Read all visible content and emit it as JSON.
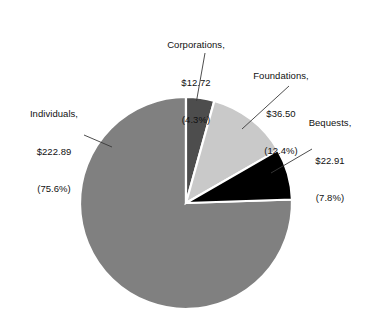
{
  "chart_data": {
    "type": "pie",
    "title": "",
    "xlabel": "",
    "ylabel": "",
    "legend_position": "none",
    "grid": false,
    "units": "billions of dollars",
    "total_value": 295.02,
    "start_angle_deg": 0,
    "direction": "clockwise",
    "categories": [
      "Corporations",
      "Foundations",
      "Bequests",
      "Individuals"
    ],
    "values": [
      12.72,
      36.5,
      22.91,
      222.89
    ],
    "percentages": [
      4.3,
      12.4,
      7.8,
      75.6
    ],
    "colors": [
      "#4d4d4d",
      "#c9c9c9",
      "#000000",
      "#808080"
    ],
    "slices": [
      {
        "name": "Corporations",
        "value": 12.72,
        "value_label": "$12.72",
        "percent": 4.3,
        "percent_label": "(4.3%)",
        "color": "#4d4d4d",
        "start_deg": 0,
        "end_deg": 15.5
      },
      {
        "name": "Foundations",
        "value": 36.5,
        "value_label": "$36.50",
        "percent": 12.4,
        "percent_label": "(12.4%)",
        "color": "#c9c9c9",
        "start_deg": 15.5,
        "end_deg": 60.1
      },
      {
        "name": "Bequests",
        "value": 22.91,
        "value_label": "$22.91",
        "percent": 7.8,
        "percent_label": "(7.8%)",
        "color": "#000000",
        "start_deg": 60.1,
        "end_deg": 88.1
      },
      {
        "name": "Individuals",
        "value": 222.89,
        "value_label": "$222.89",
        "percent": 75.6,
        "percent_label": "(75.6%)",
        "color": "#808080",
        "start_deg": 88.1,
        "end_deg": 360
      }
    ]
  },
  "labels": {
    "corporations": {
      "line1": "Corporations,",
      "line2": "$12.72",
      "line3": "(4.3%)"
    },
    "foundations": {
      "line1": "Foundations,",
      "line2": "$36.50",
      "line3": "(12.4%)"
    },
    "bequests": {
      "line1": "Bequests,",
      "line2": "$22.91",
      "line3": "(7.8%)"
    },
    "individuals": {
      "line1": "Individuals,",
      "line2": "$222.89",
      "line3": "(75.6%)"
    }
  }
}
